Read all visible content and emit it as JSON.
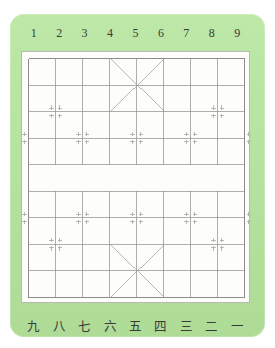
{
  "panel": {
    "background_color": "#b9e5a4",
    "board_background_color": "#fdfdfc",
    "line_color": "#8d8d88",
    "marker_color": "#b0b0ac",
    "label_color": "#3a3a38"
  },
  "top_labels": {
    "name": "file-numbers-arabic",
    "cells": [
      "1",
      "2",
      "3",
      "4",
      "5",
      "6",
      "7",
      "8",
      "9"
    ]
  },
  "bottom_labels": {
    "name": "file-numbers-chinese",
    "cells": [
      "九",
      "八",
      "七",
      "六",
      "五",
      "四",
      "三",
      "二",
      "一"
    ]
  },
  "chart_data": {
    "type": "table",
    "xlabel": "files",
    "ylabel": "ranks",
    "files": 9,
    "ranks": 10,
    "x": [
      0,
      1,
      2,
      3,
      4,
      5,
      6,
      7,
      8
    ],
    "categories": [
      "1",
      "2",
      "3",
      "4",
      "5",
      "6",
      "7",
      "8",
      "9"
    ],
    "values": [
      10,
      10,
      10,
      10,
      10,
      10,
      10,
      10,
      10
    ],
    "grid": true,
    "legend": "none",
    "river": {
      "between_ranks": [
        4,
        5
      ],
      "vertical_lines_drawn": false
    },
    "palaces": [
      {
        "name": "top-palace",
        "files": [
          3,
          5
        ],
        "ranks": [
          0,
          2
        ],
        "diagonals": [
          "3,0-5,2",
          "5,0-3,2"
        ]
      },
      {
        "name": "bottom-palace",
        "files": [
          3,
          5
        ],
        "ranks": [
          7,
          9
        ],
        "diagonals": [
          "3,7-5,9",
          "5,7-3,9"
        ]
      }
    ],
    "markers_full": [
      {
        "file": 1,
        "rank": 2
      },
      {
        "file": 7,
        "rank": 2
      },
      {
        "file": 2,
        "rank": 3
      },
      {
        "file": 4,
        "rank": 3
      },
      {
        "file": 6,
        "rank": 3
      },
      {
        "file": 2,
        "rank": 6
      },
      {
        "file": 4,
        "rank": 6
      },
      {
        "file": 6,
        "rank": 6
      },
      {
        "file": 1,
        "rank": 7
      },
      {
        "file": 7,
        "rank": 7
      }
    ],
    "markers_half": [
      {
        "file": 0,
        "rank": 3,
        "side": "right"
      },
      {
        "file": 8,
        "rank": 3,
        "side": "left"
      },
      {
        "file": 0,
        "rank": 6,
        "side": "right"
      },
      {
        "file": 8,
        "rank": 6,
        "side": "left"
      }
    ]
  }
}
